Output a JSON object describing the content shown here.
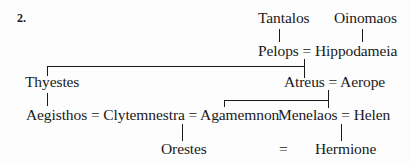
{
  "figure": {
    "number": "2.",
    "nodes": {
      "tantalos": "Tantalos",
      "oinomaos": "Oinomaos",
      "pelops_hippodameia": "Pelops = Hippodameia",
      "thyestes": "Thyestes",
      "atreus_aerope": "Atreus = Aerope",
      "aegisthos_clytemnestra_agamemnon": "Aegisthos = Clytemnestra = Agamemnon",
      "menelaos_helen": "Menelaos = Helen",
      "orestes": "Orestes",
      "marriage_sign": "=",
      "hermione": "Hermione"
    },
    "relations": [
      {
        "parent": "Tantalos",
        "child": "Pelops"
      },
      {
        "parent": "Oinomaos",
        "child": "Hippodameia"
      },
      {
        "parents": "Pelops = Hippodameia",
        "children": [
          "Thyestes",
          "Atreus"
        ]
      },
      {
        "parent": "Thyestes",
        "child": "Aegisthos"
      },
      {
        "parents": "Atreus = Aerope",
        "children": [
          "Agamemnon",
          "Menelaos"
        ]
      },
      {
        "parents": "Clytemnestra = Agamemnon",
        "child": "Orestes"
      },
      {
        "parents": "Menelaos = Helen",
        "child": "Hermione"
      },
      {
        "marriage": [
          "Orestes",
          "Hermione"
        ]
      }
    ]
  }
}
